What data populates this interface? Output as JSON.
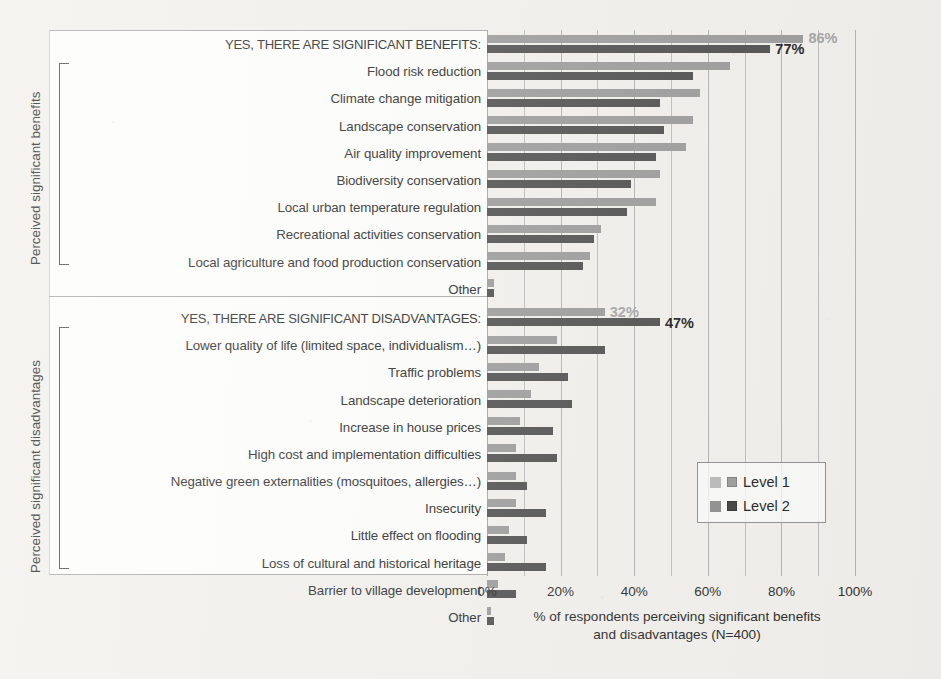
{
  "chart_data": {
    "type": "bar",
    "orientation": "horizontal",
    "title": "",
    "xlabel": "% of respondents perceiving significant benefits and disadvantages (N=400)",
    "xlabel_line1": "% of respondents perceiving significant benefits",
    "xlabel_line2": "and disadvantages (N=400)",
    "ylabel_groups": [
      "Perceived significant benefits",
      "Perceived significant disadvantages"
    ],
    "xlim": [
      0,
      100
    ],
    "xticks": [
      "0%",
      "20%",
      "40%",
      "60%",
      "80%",
      "100%"
    ],
    "xtick_values": [
      0,
      20,
      40,
      60,
      80,
      100
    ],
    "grid": true,
    "gridline_step": 10,
    "legend": {
      "position": "middle-right",
      "entries": [
        {
          "name": "Level 1",
          "color": "#9b9b9b"
        },
        {
          "name": "Level 2",
          "color": "#4f4f4f"
        }
      ]
    },
    "series": [
      {
        "name": "Level 1",
        "color": "#9b9b9b"
      },
      {
        "name": "Level 2",
        "color": "#4f4f4f"
      }
    ],
    "groups": [
      {
        "group_label": "Perceived significant benefits",
        "header": {
          "category": "YES, THERE ARE SIGNIFICANT BENEFITS:",
          "level1": 86,
          "level2": 77,
          "level1_datalabel": "86%",
          "level2_datalabel": "77%"
        },
        "rows": [
          {
            "category": "Flood risk reduction",
            "level1": 66,
            "level2": 56
          },
          {
            "category": "Climate change mitigation",
            "level1": 58,
            "level2": 47
          },
          {
            "category": "Landscape conservation",
            "level1": 56,
            "level2": 48
          },
          {
            "category": "Air quality improvement",
            "level1": 54,
            "level2": 46
          },
          {
            "category": "Biodiversity conservation",
            "level1": 47,
            "level2": 39
          },
          {
            "category": "Local urban temperature regulation",
            "level1": 46,
            "level2": 38
          },
          {
            "category": "Recreational activities conservation",
            "level1": 31,
            "level2": 29
          },
          {
            "category": "Local agriculture and food production conservation",
            "level1": 28,
            "level2": 26
          },
          {
            "category": "Other",
            "level1": 2,
            "level2": 2
          }
        ]
      },
      {
        "group_label": "Perceived significant disadvantages",
        "header": {
          "category": "YES, THERE ARE SIGNIFICANT DISADVANTAGES:",
          "level1": 32,
          "level2": 47,
          "level1_datalabel": "32%",
          "level2_datalabel": "47%"
        },
        "rows": [
          {
            "category": "Lower quality of life (limited space, individualism…)",
            "level1": 19,
            "level2": 32
          },
          {
            "category": "Traffic problems",
            "level1": 14,
            "level2": 22
          },
          {
            "category": "Landscape deterioration",
            "level1": 12,
            "level2": 23
          },
          {
            "category": "Increase in house prices",
            "level1": 9,
            "level2": 18
          },
          {
            "category": "High cost and implementation difficulties",
            "level1": 8,
            "level2": 19
          },
          {
            "category": "Negative green externalities (mosquitoes, allergies…)",
            "level1": 8,
            "level2": 11
          },
          {
            "category": "Insecurity",
            "level1": 8,
            "level2": 16
          },
          {
            "category": "Little effect on flooding",
            "level1": 6,
            "level2": 11
          },
          {
            "category": "Loss of cultural and historical heritage",
            "level1": 5,
            "level2": 16
          },
          {
            "category": "Barrier to village development",
            "level1": 3,
            "level2": 8
          },
          {
            "category": "Other",
            "level1": 1,
            "level2": 2
          }
        ]
      }
    ]
  }
}
